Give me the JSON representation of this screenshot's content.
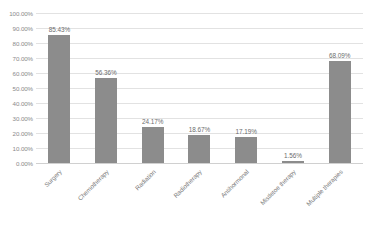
{
  "chart_data": {
    "type": "bar",
    "title": "",
    "subtitle": "",
    "xlabel": "",
    "ylabel": "",
    "categories": [
      "Surgery",
      "Chemotherapy",
      "Radiation",
      "Radiotherapy",
      "Antihormonal",
      "Mistletoe therapy",
      "Multiple therapies"
    ],
    "values": [
      85.43,
      56.36,
      24.17,
      18.67,
      17.19,
      1.56,
      68.09
    ],
    "value_labels": [
      "85.43%",
      "56.36%",
      "24.17%",
      "18.67%",
      "17.19%",
      "1.56%",
      "68.09%"
    ],
    "ylim": [
      0,
      100
    ],
    "ytick_values": [
      0,
      10,
      20,
      30,
      40,
      50,
      60,
      70,
      80,
      90,
      100
    ],
    "ytick_labels": [
      "0.00%",
      "10.00%",
      "20.00%",
      "30.00%",
      "40.00%",
      "50.00%",
      "60.00%",
      "70.00%",
      "80.00%",
      "90.00%",
      "100.00%"
    ],
    "grid": true,
    "legend": false,
    "legend_position": "none",
    "series": [
      {
        "name": "",
        "values": [
          85.43,
          56.36,
          24.17,
          18.67,
          17.19,
          1.56,
          68.09
        ]
      }
    ],
    "colors": {
      "bar": "#8c8c8c",
      "gridline": "#e2e2e2",
      "axis": "#d0d0d0",
      "tick_text": "#8a8a8a",
      "value_text": "#6d6d6d",
      "category_text": "#7d7d7d",
      "background": "#ffffff"
    }
  }
}
